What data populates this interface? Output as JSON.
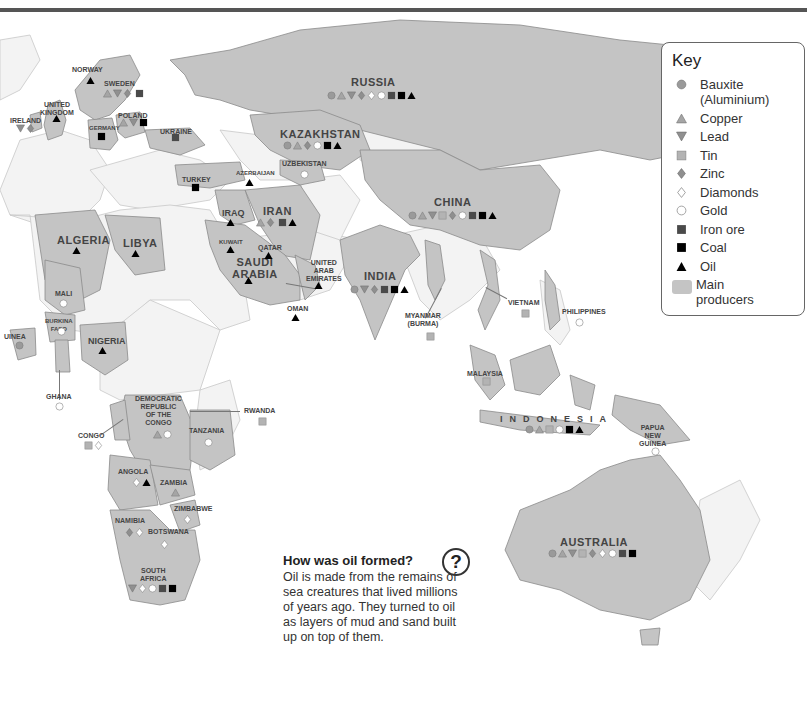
{
  "key": {
    "title": "Key",
    "items": [
      {
        "symbol": "circle-grey",
        "label": "Bauxite (Aluminium)"
      },
      {
        "symbol": "triangle-up-grey",
        "label": "Copper"
      },
      {
        "symbol": "triangle-down-grey",
        "label": "Lead"
      },
      {
        "symbol": "square-lightgrey",
        "label": "Tin"
      },
      {
        "symbol": "diamond-grey",
        "label": "Zinc"
      },
      {
        "symbol": "diamond-white",
        "label": "Diamonds"
      },
      {
        "symbol": "circle-white",
        "label": "Gold"
      },
      {
        "symbol": "square-darkgrey",
        "label": "Iron ore"
      },
      {
        "symbol": "square-black",
        "label": "Coal"
      },
      {
        "symbol": "triangle-up-black",
        "label": "Oil"
      },
      {
        "symbol": "swatch-grey",
        "label": "Main producers"
      }
    ]
  },
  "info_box": {
    "icon": "question-icon",
    "title": "How was oil formed?",
    "body": "Oil is made from the remains of sea creatures that lived millions of years ago. They turned to oil as layers of mud and sand built up on top of them."
  },
  "countries": {
    "norway": {
      "name": "Norway",
      "resources": [
        "oil"
      ]
    },
    "sweden": {
      "name": "Sweden",
      "resources": [
        "copper",
        "lead",
        "zinc",
        "iron_ore"
      ]
    },
    "united_kingdom": {
      "name": "United Kingdom",
      "resources": [
        "oil"
      ]
    },
    "ireland": {
      "name": "Ireland",
      "resources": [
        "lead",
        "zinc"
      ]
    },
    "germany": {
      "name": "Germany",
      "resources": [
        "coal"
      ]
    },
    "poland": {
      "name": "Poland",
      "resources": [
        "copper",
        "lead",
        "coal"
      ]
    },
    "ukraine": {
      "name": "Ukraine",
      "resources": [
        "iron_ore"
      ]
    },
    "russia": {
      "name": "Russia",
      "resources": [
        "bauxite",
        "copper",
        "lead",
        "zinc",
        "diamonds",
        "gold",
        "iron_ore",
        "coal",
        "oil"
      ]
    },
    "kazakhstan": {
      "name": "Kazakhstan",
      "resources": [
        "bauxite",
        "copper",
        "zinc",
        "gold",
        "coal",
        "oil"
      ]
    },
    "uzbekistan": {
      "name": "Uzbekistan",
      "resources": [
        "gold"
      ]
    },
    "turkey": {
      "name": "Turkey",
      "resources": [
        "coal"
      ]
    },
    "azerbaijan": {
      "name": "Azerbaijan",
      "resources": [
        "oil"
      ]
    },
    "iraq": {
      "name": "Iraq",
      "resources": [
        "oil"
      ]
    },
    "iran": {
      "name": "Iran",
      "resources": [
        "copper",
        "zinc",
        "iron_ore",
        "oil"
      ]
    },
    "kuwait": {
      "name": "Kuwait",
      "resources": [
        "oil"
      ]
    },
    "qatar": {
      "name": "Qatar",
      "resources": [
        "oil"
      ]
    },
    "saudi_arabia": {
      "name": "Saudi Arabia",
      "resources": [
        "oil"
      ]
    },
    "uae": {
      "name": "United Arab Emirates",
      "resources": [
        "oil"
      ]
    },
    "oman": {
      "name": "Oman",
      "resources": [
        "oil"
      ]
    },
    "china": {
      "name": "China",
      "resources": [
        "bauxite",
        "copper",
        "lead",
        "tin",
        "zinc",
        "gold",
        "iron_ore",
        "coal",
        "oil"
      ]
    },
    "india": {
      "name": "India",
      "resources": [
        "bauxite",
        "lead",
        "zinc",
        "iron_ore",
        "coal",
        "oil"
      ]
    },
    "myanmar": {
      "name": "Myanmar (Burma)",
      "resources": [
        "tin"
      ]
    },
    "vietnam": {
      "name": "Vietnam",
      "resources": [
        "tin"
      ]
    },
    "philippines": {
      "name": "Philippines",
      "resources": [
        "gold"
      ]
    },
    "malaysia": {
      "name": "Malaysia",
      "resources": [
        "tin"
      ]
    },
    "indonesia": {
      "name": "Indonesia",
      "resources": [
        "bauxite",
        "copper",
        "tin",
        "gold",
        "coal",
        "oil"
      ]
    },
    "papua_new_guinea": {
      "name": "Papua New Guinea",
      "resources": [
        "gold"
      ]
    },
    "australia": {
      "name": "Australia",
      "resources": [
        "bauxite",
        "copper",
        "lead",
        "tin",
        "zinc",
        "diamonds",
        "gold",
        "iron_ore",
        "coal"
      ]
    },
    "algeria": {
      "name": "Algeria",
      "resources": [
        "oil"
      ]
    },
    "libya": {
      "name": "Libya",
      "resources": [
        "oil"
      ]
    },
    "mali": {
      "name": "Mali",
      "resources": [
        "gold"
      ]
    },
    "burkina_faso": {
      "name": "Burkina Faso",
      "resources": [
        "gold"
      ]
    },
    "guinea": {
      "name": "Guinea",
      "resources": [
        "bauxite"
      ]
    },
    "ghana": {
      "name": "Ghana",
      "resources": [
        "gold"
      ]
    },
    "nigeria": {
      "name": "Nigeria",
      "resources": [
        "oil"
      ]
    },
    "drc": {
      "name": "Democratic Republic of the Congo",
      "resources": [
        "copper",
        "gold"
      ]
    },
    "congo": {
      "name": "Congo",
      "resources": [
        "tin",
        "diamonds"
      ]
    },
    "rwanda": {
      "name": "Rwanda",
      "resources": [
        "tin"
      ]
    },
    "tanzania": {
      "name": "Tanzania",
      "resources": [
        "gold"
      ]
    },
    "angola": {
      "name": "Angola",
      "resources": [
        "diamonds",
        "oil"
      ]
    },
    "zambia": {
      "name": "Zambia",
      "resources": [
        "copper"
      ]
    },
    "zimbabwe": {
      "name": "Zimbabwe",
      "resources": [
        "diamonds"
      ]
    },
    "namibia": {
      "name": "Namibia",
      "resources": [
        "zinc",
        "diamonds"
      ]
    },
    "botswana": {
      "name": "Botswana",
      "resources": [
        "diamonds"
      ]
    },
    "south_africa": {
      "name": "South Africa",
      "resources": [
        "lead",
        "diamonds",
        "gold",
        "iron_ore",
        "coal"
      ]
    }
  },
  "labels": {
    "norway": "NORWAY",
    "sweden": "SWEDEN",
    "uk": "UNITED\nKINGDOM",
    "ireland": "IRELAND",
    "germany": "GERMANY",
    "poland": "POLAND",
    "ukraine": "UKRAINE",
    "russia": "RUSSIA",
    "kazakhstan": "KAZAKHSTAN",
    "uzbekistan": "UZBEKISTAN",
    "turkey": "TURKEY",
    "azerbaijan": "AZERBAIJAN",
    "iraq": "IRAQ",
    "iran": "IRAN",
    "kuwait": "KUWAIT",
    "qatar": "QATAR",
    "saudi": "SAUDI\nARABIA",
    "uae": "UNITED\nARAB\nEMIRATES",
    "oman": "OMAN",
    "china": "CHINA",
    "india": "INDIA",
    "myanmar": "MYANMAR\n(BURMA)",
    "vietnam": "VIETNAM",
    "philippines": "PHILIPPINES",
    "malaysia": "MALAYSIA",
    "indonesia": "INDONESIA",
    "png": "PAPUA\nNEW\nGUINEA",
    "australia": "AUSTRALIA",
    "algeria": "ALGERIA",
    "libya": "LIBYA",
    "mali": "MALI",
    "burkina": "BURKINA\nFASO",
    "guinea": "UINEA",
    "ghana": "GHANA",
    "nigeria": "NIGERIA",
    "drc": "DEMOCRATIC\nREPUBLIC\nOF THE\nCONGO",
    "congo": "CONGO",
    "rwanda": "RWANDA",
    "tanzania": "TANZANIA",
    "angola": "ANGOLA",
    "zambia": "ZAMBIA",
    "zimbabwe": "ZIMBABWE",
    "namibia": "NAMIBIA",
    "botswana": "BOTSWANA",
    "south_africa": "SOUTH\nAFRICA"
  },
  "colors": {
    "main_producer": "#c4c4c4",
    "other_land": "#f3f3f3",
    "sea": "#ffffff",
    "border": "#8a8a8a"
  }
}
